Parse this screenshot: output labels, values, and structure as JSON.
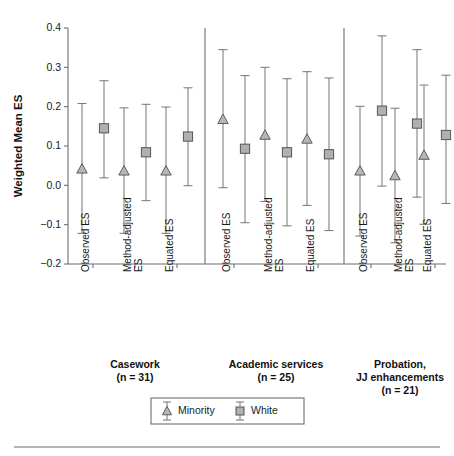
{
  "chart_data": {
    "type": "scatter",
    "title": "",
    "subtitle": "",
    "xlabel": "",
    "ylabel": "Weighted Mean ES",
    "ylim": [
      -0.2,
      0.4
    ],
    "yticks": [
      "0.4",
      "0.3",
      "0.2",
      "0.1",
      "0.0",
      "-0.1",
      "-0.2"
    ],
    "ytick_values": [
      0.4,
      0.3,
      0.2,
      0.1,
      0.0,
      -0.1,
      -0.2
    ],
    "grid": false,
    "legend_position": "bottom-center",
    "error_bar_type": "confidence-interval",
    "legend": [
      {
        "name": "Minority",
        "marker": "triangle",
        "color": "#b6b6b6"
      },
      {
        "name": "White",
        "marker": "square",
        "color": "#b0b0b0"
      }
    ],
    "series": [
      {
        "name": "Minority",
        "marker": "triangle"
      },
      {
        "name": "White",
        "marker": "square"
      }
    ],
    "groups": [
      {
        "label": "Casework",
        "n_label": "(n = 31)",
        "conditions": [
          {
            "label": "Observed ES",
            "Minority": {
              "value": 0.042,
              "lower": -0.122,
              "upper": 0.208
            },
            "White": {
              "value": 0.145,
              "lower": 0.019,
              "upper": 0.266
            }
          },
          {
            "label": "Method-adjusted ES",
            "Minority": {
              "value": 0.037,
              "lower": -0.122,
              "upper": 0.197
            },
            "White": {
              "value": 0.084,
              "lower": -0.039,
              "upper": 0.206
            }
          },
          {
            "label": "Equated ES",
            "Minority": {
              "value": 0.037,
              "lower": -0.122,
              "upper": 0.199
            },
            "White": {
              "value": 0.124,
              "lower": -0.001,
              "upper": 0.248
            }
          }
        ]
      },
      {
        "label": "Academic services",
        "n_label": "(n = 25)",
        "conditions": [
          {
            "label": "Observed ES",
            "Minority": {
              "value": 0.168,
              "lower": -0.006,
              "upper": 0.345
            },
            "White": {
              "value": 0.093,
              "lower": -0.095,
              "upper": 0.279
            }
          },
          {
            "label": "Method-adjusted ES",
            "Minority": {
              "value": 0.128,
              "lower": -0.041,
              "upper": 0.3
            },
            "White": {
              "value": 0.084,
              "lower": -0.103,
              "upper": 0.271
            }
          },
          {
            "label": "Equated ES",
            "Minority": {
              "value": 0.118,
              "lower": -0.051,
              "upper": 0.289
            },
            "White": {
              "value": 0.079,
              "lower": -0.115,
              "upper": 0.273
            }
          }
        ]
      },
      {
        "label": "Probation, JJ enhancements",
        "label_line1": "Probation,",
        "label_line2": "JJ enhancements",
        "n_label": "(n = 21)",
        "conditions": [
          {
            "label": "Observed ES",
            "Minority": {
              "value": 0.037,
              "lower": -0.129,
              "upper": 0.201
            },
            "White": {
              "value": 0.19,
              "lower": -0.002,
              "upper": 0.38
            }
          },
          {
            "label": "Method-adjusted ES",
            "Minority": {
              "value": 0.025,
              "lower": -0.146,
              "upper": 0.196
            },
            "White": {
              "value": 0.157,
              "lower": -0.03,
              "upper": 0.345
            }
          },
          {
            "label": "Equated ES",
            "Minority": {
              "value": 0.077,
              "lower": -0.099,
              "upper": 0.255
            },
            "White": {
              "value": 0.128,
              "lower": -0.046,
              "upper": 0.28
            }
          }
        ]
      }
    ]
  },
  "axis": {
    "y_title": "Weighted Mean ES"
  },
  "xtick_labels": [
    "Observed ES",
    "Method-adjusted ES",
    "Equated ES",
    "Observed ES",
    "Method-adjusted ES",
    "Equated ES",
    "Observed ES",
    "Method-adjusted ES",
    "Equated ES"
  ],
  "colors": {
    "minority_marker": "#b6b6b6",
    "white_marker": "#b0b0b0",
    "marker_edge": "#555555",
    "error_bar": "#7a7a7a",
    "axis": "#6e6e6e",
    "text": "#1a1a1a",
    "footer_rule": "#9b9b9b"
  }
}
